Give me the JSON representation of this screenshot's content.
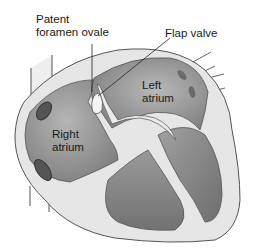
{
  "diagram": {
    "labels": {
      "pfo_line1": "Patent",
      "pfo_line2": "foramen ovale",
      "flap_valve": "Flap valve",
      "left_atrium_line1": "Left",
      "left_atrium_line2": "atrium",
      "right_atrium_line1": "Right",
      "right_atrium_line2": "atrium"
    },
    "colors": {
      "wall": "#e6e6e6",
      "chamber_dark": "#7a7a7a",
      "chamber_mid": "#a8a8a8",
      "outline": "#555555",
      "leader": "#222222"
    }
  }
}
